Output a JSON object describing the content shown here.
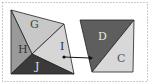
{
  "diagram": {
    "left_shape": {
      "regions": [
        {
          "label": "G",
          "fill": "#c8c8c8",
          "points": "11,10 64,24 32,54",
          "label_pos": [
            30,
            28
          ],
          "text_color": "#444444"
        },
        {
          "label": "H",
          "fill": "#9a9a9a",
          "points": "11,10 32,54 11,74",
          "label_pos": [
            18,
            53
          ],
          "text_color": "#333333"
        },
        {
          "label": "I",
          "fill": "#d6d6d6",
          "points": "64,24 74,74 32,54",
          "label_pos": [
            60,
            50
          ],
          "text_color": "#333333"
        },
        {
          "label": "J",
          "fill": "#3a3a3a",
          "points": "32,54 74,74 11,74",
          "label_pos": [
            35,
            70
          ],
          "text_color": "#e0e0e0"
        }
      ]
    },
    "right_shape": {
      "regions": [
        {
          "label": "D",
          "fill": "#5e5e5e",
          "points": "80,20 134,20 92,72",
          "label_pos": [
            98,
            40
          ],
          "text_color": "#e8e8e8"
        },
        {
          "label": "C",
          "fill": "#d8d8d8",
          "points": "134,20 133,72 92,72",
          "label_pos": [
            117,
            62
          ],
          "text_color": "#555555"
        }
      ]
    },
    "arrow": {
      "from": [
        64,
        57
      ],
      "to": [
        93,
        58
      ]
    },
    "border_color": "#999999"
  }
}
